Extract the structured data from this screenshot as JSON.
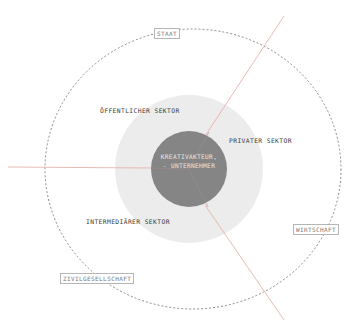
{
  "diagram": {
    "center": {
      "line1": "KREATIVAKTEUR,",
      "line2": "- UNTERNEHMER"
    },
    "sectors": {
      "public": "ÖFFENTLICHER SEKTOR",
      "private": "PRIVATER SEKTOR",
      "intermediary": "INTERMEDIÄRER SEKTOR"
    },
    "spheres": {
      "state": "STAAT",
      "economy": "WIRTSCHAFT",
      "civil_society": "ZIVILGESELLSCHAFT"
    },
    "colors": {
      "dark_core": "#858585",
      "light_ring": "#ececec",
      "divider_lines": "#e3a9a2",
      "dashed_outline": "#6f6f6f"
    }
  }
}
